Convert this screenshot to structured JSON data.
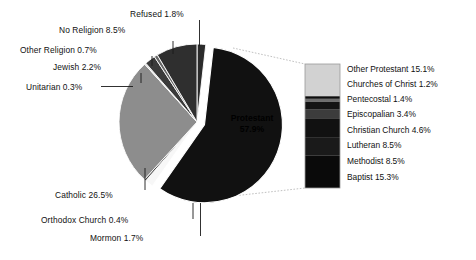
{
  "chart_data": {
    "type": "pie",
    "title": "",
    "subtitle": "",
    "xlabel": "",
    "ylabel": "",
    "legend_position": "right",
    "grid": false,
    "units": "percent",
    "categories": [
      "Refused",
      "Protestant",
      "Mormon",
      "Orthodox Church",
      "Catholic",
      "Unitarian",
      "Jewish",
      "Other Religion",
      "No Religion"
    ],
    "values": [
      1.8,
      57.9,
      1.7,
      0.4,
      26.5,
      0.3,
      2.2,
      0.7,
      8.5
    ],
    "slice_labels": [
      "Refused 1.8%",
      "Protestant 57.9%",
      "Mormon 1.7%",
      "Orthodox Church 0.4%",
      "Catholic 26.5%",
      "Unitarian 0.3%",
      "Jewish 2.2%",
      "Other Religion 0.7%",
      "No Religion 8.5%"
    ],
    "exploded": [
      "Protestant"
    ],
    "colors": [
      "#2b2b2b",
      "#111111",
      "#f7f7f7",
      "#4a4a4a",
      "#8d8d8d",
      "#d9d9d9",
      "#3a3a3a",
      "#666666",
      "#2f2f2f"
    ],
    "breakout": {
      "of": "Protestant",
      "type": "stacked_bar",
      "categories": [
        "Other Protestant",
        "Churches of Christ",
        "Pentecostal",
        "Episcopalian",
        "Christian Church",
        "Lutheran",
        "Methodist",
        "Baptist"
      ],
      "values": [
        15.1,
        1.2,
        1.4,
        3.4,
        4.6,
        8.5,
        8.5,
        15.3
      ],
      "labels": [
        "Other Protestant 15.1%",
        "Churches of Christ 1.2%",
        "Pentecostal 1.4%",
        "Episcopalian 3.4%",
        "Christian Church 4.6%",
        "Lutheran 8.5%",
        "Methodist 8.5%",
        "Baptist 15.3%"
      ],
      "colors": [
        "#d2d2d2",
        "#0d0d0d",
        "#6e6e6e",
        "#141414",
        "#3c3c3c",
        "#111111",
        "#1a1a1a",
        "#0a0a0a"
      ]
    }
  },
  "pie": {
    "center_label_name": "Protestant",
    "center_label_value": "57.9%",
    "callouts": [
      {
        "text": "Refused 1.8%"
      },
      {
        "text": "No Religion 8.5%"
      },
      {
        "text": "Other Religion 0.7%"
      },
      {
        "text": "Jewish 2.2%"
      },
      {
        "text": "Unitarian 0.3%"
      },
      {
        "text": "Catholic 26.5%"
      },
      {
        "text": "Orthodox Church 0.4%"
      },
      {
        "text": "Mormon 1.7%"
      }
    ]
  },
  "legend": {
    "items": [
      {
        "text": "Other Protestant 15.1%"
      },
      {
        "text": "Churches of Christ 1.2%"
      },
      {
        "text": "Pentecostal 1.4%"
      },
      {
        "text": "Episcopalian 3.4%"
      },
      {
        "text": "Christian Church 4.6%"
      },
      {
        "text": "Lutheran 8.5%"
      },
      {
        "text": "Methodist 8.5%"
      },
      {
        "text": "Baptist 15.3%"
      }
    ]
  },
  "colors": {
    "background": "#ffffff",
    "text": "#111111",
    "leader": "#1a1a1a",
    "connector": "#b9b9b9"
  }
}
